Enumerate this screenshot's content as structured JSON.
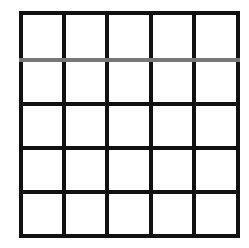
{
  "diagram": {
    "type": "grid",
    "rows": 5,
    "cols": 5,
    "x_lines": [
      21,
      64,
      107,
      151,
      194,
      238
    ],
    "y_lines": [
      13,
      60,
      104,
      148,
      192,
      236
    ],
    "line_color": "#111111",
    "line_width": 4,
    "highlighted_lines": [
      {
        "axis": "horizontal",
        "index": 1,
        "color": "#777777"
      }
    ],
    "cell_fill": "#ffffff"
  }
}
